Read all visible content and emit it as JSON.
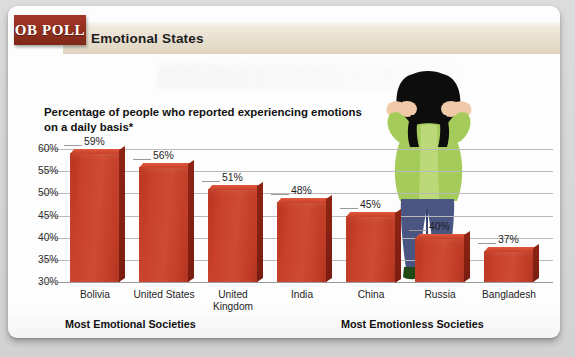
{
  "brand": {
    "logo_text": "OB POLL",
    "logo_color": "#93301f"
  },
  "header": {
    "title": "Emotional States",
    "band_color": "#e6ddcc"
  },
  "subtitle": "Percentage of people who reported experiencing emotions on a daily basis*",
  "groups": {
    "left_label": "Most Emotional Societies",
    "right_label": "Most Emotionless Societies"
  },
  "illustration": {
    "name": "woman-hands-on-head",
    "hair_color": "#0d0d0d",
    "top_color": "#a5cc5a",
    "pants_color": "#4a5581",
    "skin_color": "#f0c9a8",
    "shoe_color": "#1f4a16"
  },
  "chart_data": {
    "type": "bar",
    "title": "Emotional States",
    "subtitle": "Percentage of people who reported experiencing emotions on a daily basis*",
    "xlabel": "",
    "ylabel": "",
    "categories": [
      "Bolivia",
      "United States",
      "United Kingdom",
      "India",
      "China",
      "Russia",
      "Bangladesh"
    ],
    "values": [
      59,
      56,
      51,
      48,
      45,
      40,
      37
    ],
    "value_labels": [
      "59%",
      "56%",
      "51%",
      "48%",
      "45%",
      "40%",
      "37%"
    ],
    "ylim": [
      30,
      60
    ],
    "yticks": [
      60,
      55,
      50,
      45,
      40,
      35,
      30
    ],
    "ytick_labels": [
      "60%",
      "55%",
      "50%",
      "45%",
      "40%",
      "35%",
      "30%"
    ],
    "grid": true,
    "legend": "none",
    "bar_color": "#c54028",
    "groups": [
      {
        "label": "Most Emotional Societies",
        "categories": [
          "Bolivia",
          "United States",
          "United Kingdom",
          "India"
        ]
      },
      {
        "label": "Most Emotionless Societies",
        "categories": [
          "China",
          "Russia",
          "Bangladesh"
        ]
      }
    ]
  }
}
